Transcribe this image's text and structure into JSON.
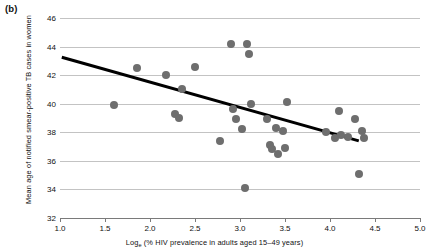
{
  "figure": {
    "panel_label": "(b)"
  },
  "chart_data": {
    "type": "scatter",
    "title": "",
    "panel": "(b)",
    "xlabel_prefix": "Log",
    "xlabel_subscript": "e",
    "xlabel_rest": " (% HIV prevalence in adults aged 15–49 years)",
    "xlabel": "Log_e (% HIV prevalence in adults aged 15–49 years)",
    "ylabel": "Mean age of notified smear-positive TB cases in women",
    "xlim": [
      1.0,
      5.0
    ],
    "ylim": [
      32,
      46
    ],
    "xticks": [
      "1.0",
      "1.5",
      "2.0",
      "2.5",
      "3.0",
      "3.5",
      "4.0",
      "4.5",
      "5.0"
    ],
    "xtick_values": [
      1.0,
      1.5,
      2.0,
      2.5,
      3.0,
      3.5,
      4.0,
      4.5,
      5.0
    ],
    "yticks": [
      "32",
      "34",
      "36",
      "38",
      "40",
      "42",
      "44",
      "46"
    ],
    "ytick_values": [
      32,
      34,
      36,
      38,
      40,
      42,
      44,
      46
    ],
    "grid": "horizontal",
    "legend": "none",
    "marker_color": "#6e6e6e",
    "marker_size": 8,
    "gridline_color": "#c3c3c3",
    "axis_color": "#7a7a7a",
    "trendline": {
      "color": "#000000",
      "width": 3,
      "x": [
        1.02,
        4.32
      ],
      "y": [
        43.25,
        37.4
      ]
    },
    "points": [
      {
        "x": 1.6,
        "y": 39.9
      },
      {
        "x": 1.85,
        "y": 42.5
      },
      {
        "x": 2.18,
        "y": 42.0
      },
      {
        "x": 2.28,
        "y": 39.3
      },
      {
        "x": 2.32,
        "y": 39.0
      },
      {
        "x": 2.36,
        "y": 41.0
      },
      {
        "x": 2.5,
        "y": 42.6
      },
      {
        "x": 2.78,
        "y": 37.4
      },
      {
        "x": 2.9,
        "y": 44.2
      },
      {
        "x": 2.92,
        "y": 39.6
      },
      {
        "x": 2.95,
        "y": 38.9
      },
      {
        "x": 3.02,
        "y": 38.2
      },
      {
        "x": 3.05,
        "y": 34.1
      },
      {
        "x": 3.08,
        "y": 44.2
      },
      {
        "x": 3.1,
        "y": 43.5
      },
      {
        "x": 3.12,
        "y": 40.0
      },
      {
        "x": 3.3,
        "y": 38.9
      },
      {
        "x": 3.33,
        "y": 37.1
      },
      {
        "x": 3.36,
        "y": 36.8
      },
      {
        "x": 3.4,
        "y": 38.3
      },
      {
        "x": 3.42,
        "y": 36.5
      },
      {
        "x": 3.48,
        "y": 38.1
      },
      {
        "x": 3.5,
        "y": 36.9
      },
      {
        "x": 3.52,
        "y": 40.1
      },
      {
        "x": 3.95,
        "y": 38.0
      },
      {
        "x": 4.05,
        "y": 37.6
      },
      {
        "x": 4.1,
        "y": 39.5
      },
      {
        "x": 4.12,
        "y": 37.8
      },
      {
        "x": 4.2,
        "y": 37.7
      },
      {
        "x": 4.28,
        "y": 38.9
      },
      {
        "x": 4.32,
        "y": 35.1
      },
      {
        "x": 4.35,
        "y": 38.1
      },
      {
        "x": 4.38,
        "y": 37.6
      }
    ]
  }
}
